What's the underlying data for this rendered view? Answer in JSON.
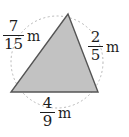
{
  "figure": {
    "type": "inscribed-triangle-in-circle",
    "background_color": "#ffffff",
    "triangle": {
      "fill_color": "#c2c2c2",
      "stroke_color": "#555555",
      "vertices": [
        {
          "name": "apex",
          "x": 68,
          "y": 14
        },
        {
          "name": "bottom-right",
          "x": 98,
          "y": 92
        },
        {
          "name": "bottom-left",
          "x": 11,
          "y": 92
        }
      ]
    },
    "circumcircle": {
      "center_x": 57,
      "center_y": 62,
      "radius": 46,
      "stroke_color": "#b8b8b8",
      "dash": "2,2.5"
    },
    "labels": {
      "left": {
        "numerator": "7",
        "denominator": "15",
        "unit": "m",
        "side": "left-side-length"
      },
      "right": {
        "numerator": "2",
        "denominator": "5",
        "unit": "m",
        "side": "right-side-length"
      },
      "bottom": {
        "numerator": "4",
        "denominator": "9",
        "unit": "m",
        "side": "base-length"
      }
    }
  }
}
